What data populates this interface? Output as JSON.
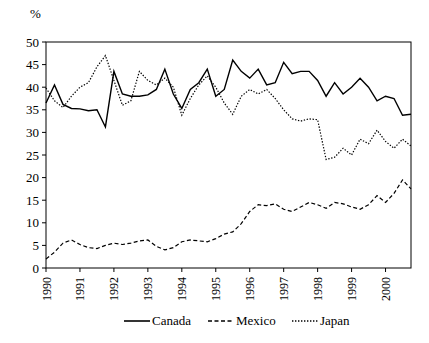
{
  "chart_data": {
    "type": "line",
    "title": "",
    "subtitle": "",
    "xlabel": "",
    "ylabel": "%",
    "ylim": [
      0,
      50
    ],
    "ytick_values": [
      0,
      5,
      10,
      15,
      20,
      25,
      30,
      35,
      40,
      45,
      50
    ],
    "ytick_labels": [
      "0",
      "5",
      "10",
      "15",
      "20",
      "25",
      "30",
      "35",
      "40",
      "45",
      "50"
    ],
    "xlim": [
      1990,
      2000.75
    ],
    "xtick_values": [
      1990,
      1991,
      1992,
      1993,
      1994,
      1995,
      1996,
      1997,
      1998,
      1999,
      2000
    ],
    "xtick_labels": [
      "1990",
      "1991",
      "1992",
      "1993",
      "1994",
      "1995",
      "1996",
      "1997",
      "1998",
      "1999",
      "2000"
    ],
    "xtick_rotation": 90,
    "grid": false,
    "legend_position": "bottom",
    "frequency": "quarterly",
    "x": [
      1990,
      1990.25,
      1990.5,
      1990.75,
      1991,
      1991.25,
      1991.5,
      1991.75,
      1992,
      1992.25,
      1992.5,
      1992.75,
      1993,
      1993.25,
      1993.5,
      1993.75,
      1994,
      1994.25,
      1994.5,
      1994.75,
      1995,
      1995.25,
      1995.5,
      1995.75,
      1996,
      1996.25,
      1996.5,
      1996.75,
      1997,
      1997.25,
      1997.5,
      1997.75,
      1998,
      1998.25,
      1998.5,
      1998.75,
      1999,
      1999.25,
      1999.5,
      1999.75,
      2000,
      2000.25,
      2000.5,
      2000.75
    ],
    "series": [
      {
        "name": "Canada",
        "style": "solid",
        "color": "#000000",
        "values": [
          36.5,
          40.5,
          36.2,
          35.3,
          35.2,
          34.8,
          35.0,
          31.2,
          43.5,
          38.5,
          38.0,
          38.0,
          38.3,
          39.5,
          44.0,
          38.5,
          35.3,
          39.5,
          41.0,
          44.0,
          38.0,
          39.5,
          46.0,
          43.5,
          42.0,
          44.0,
          40.5,
          41.0,
          45.5,
          43.0,
          43.5,
          43.5,
          41.5,
          38.0,
          41.0,
          38.5,
          40.0,
          42.0,
          40.0,
          37.0,
          38.0,
          37.5,
          33.8,
          34.0
        ]
      },
      {
        "name": "Mexico",
        "style": "dashed",
        "color": "#000000",
        "values": [
          2.0,
          3.5,
          5.5,
          6.2,
          5.2,
          4.5,
          4.3,
          5.0,
          5.5,
          5.2,
          5.5,
          6.0,
          6.2,
          4.8,
          4.0,
          4.5,
          5.8,
          6.2,
          6.0,
          5.8,
          6.5,
          7.5,
          8.0,
          9.8,
          12.5,
          14.0,
          13.8,
          14.2,
          13.0,
          12.5,
          13.5,
          14.5,
          14.0,
          13.2,
          14.5,
          14.2,
          13.5,
          13.0,
          14.0,
          16.0,
          14.5,
          16.5,
          19.5,
          17.5
        ]
      },
      {
        "name": "Japan",
        "style": "dotted",
        "color": "#000000",
        "values": [
          39.8,
          37.0,
          35.5,
          38.0,
          40.0,
          41.0,
          44.5,
          47.0,
          41.5,
          36.0,
          37.0,
          43.5,
          41.5,
          40.5,
          42.0,
          40.0,
          33.8,
          37.5,
          40.5,
          42.5,
          40.0,
          36.5,
          34.0,
          38.0,
          39.5,
          38.5,
          39.5,
          37.5,
          35.0,
          33.0,
          32.5,
          33.0,
          32.8,
          24.0,
          24.5,
          26.5,
          25.0,
          28.5,
          27.5,
          30.5,
          28.0,
          26.5,
          28.5,
          27.0
        ]
      }
    ]
  },
  "legend": {
    "items": [
      {
        "label": "Canada",
        "style": "solid"
      },
      {
        "label": "Mexico",
        "style": "dashed"
      },
      {
        "label": "Japan",
        "style": "dotted"
      }
    ]
  }
}
